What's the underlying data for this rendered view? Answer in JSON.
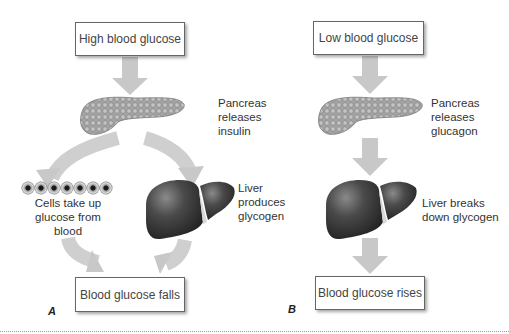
{
  "panels": {
    "a": {
      "letter": "A",
      "start": "High blood glucose",
      "pancreas": [
        "Pancreas",
        "releases",
        "insulin"
      ],
      "cells": [
        "Cells take up",
        "glucose from",
        "blood"
      ],
      "liver": [
        "Liver",
        "produces",
        "glycogen"
      ],
      "end": "Blood glucose falls"
    },
    "b": {
      "letter": "B",
      "start": "Low blood glucose",
      "pancreas": [
        "Pancreas",
        "releases",
        "glucagon"
      ],
      "liver": [
        "Liver breaks",
        "down glycogen"
      ],
      "end": "Blood glucose rises"
    }
  },
  "colors": {
    "arrow": "#c8c8c8",
    "pancreas": "#9a9a9a",
    "liver": "#3c3c3c",
    "box_border": "#666666"
  }
}
